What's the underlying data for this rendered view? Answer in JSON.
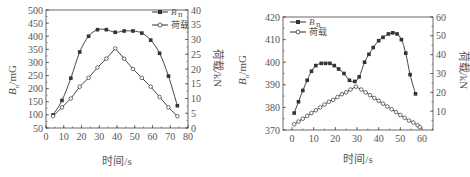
{
  "chart_data": [
    {
      "type": "line",
      "title": "",
      "xlabel": "时间/s",
      "ylabel": "B_n/mG",
      "y2label": "荷载/kN",
      "xlim": [
        0,
        80
      ],
      "ylim": [
        50,
        500
      ],
      "y2lim": [
        0,
        40
      ],
      "x_ticks": [
        "0",
        "10",
        "20",
        "30",
        "40",
        "50",
        "60",
        "70",
        "80"
      ],
      "y_ticks": [
        "50",
        "100",
        "150",
        "200",
        "250",
        "300",
        "350",
        "400",
        "450",
        "500"
      ],
      "y2_ticks": [
        "0",
        "5",
        "10",
        "15",
        "20",
        "25",
        "30",
        "35",
        "40"
      ],
      "legend": [
        "B_n",
        "荷载"
      ],
      "legend_position": "upper right",
      "grid": false,
      "series": [
        {
          "name": "B_n",
          "axis": "left",
          "marker": "filled-square",
          "x": [
            4,
            9,
            14,
            19,
            24,
            29,
            34,
            39,
            44,
            49,
            54,
            59,
            64,
            69,
            74
          ],
          "values": [
            100,
            155,
            240,
            340,
            400,
            425,
            425,
            415,
            420,
            420,
            412,
            385,
            335,
            248,
            135
          ]
        },
        {
          "name": "荷载",
          "axis": "right",
          "marker": "open-circle",
          "x": [
            4,
            9,
            14,
            19,
            24,
            29,
            34,
            39,
            44,
            49,
            54,
            59,
            64,
            69,
            74
          ],
          "values": [
            4,
            7,
            10,
            14,
            17,
            20.5,
            23.5,
            27,
            23.5,
            20,
            17,
            14,
            10.5,
            7,
            4
          ]
        }
      ]
    },
    {
      "type": "line",
      "title": "",
      "xlabel": "时间/s",
      "ylabel": "B_n/mG",
      "y2label": "荷载/kN",
      "xlim": [
        -5,
        65
      ],
      "ylim": [
        370,
        420
      ],
      "y2lim": [
        0,
        60
      ],
      "x_ticks": [
        "0",
        "10",
        "20",
        "30",
        "40",
        "50",
        "60"
      ],
      "y_ticks": [
        "370",
        "380",
        "390",
        "400",
        "410",
        "420"
      ],
      "y2_ticks": [
        "10",
        "20",
        "30",
        "40",
        "50",
        "60"
      ],
      "legend": [
        "B_n",
        "荷载"
      ],
      "legend_position": "upper left",
      "grid": false,
      "series": [
        {
          "name": "B_n",
          "axis": "left",
          "marker": "filled-square",
          "x": [
            1,
            3,
            5,
            7,
            9,
            11,
            13.5,
            15.5,
            17.5,
            19.5,
            21.5,
            24,
            26.5,
            29,
            31,
            33.5,
            35.5,
            37.5,
            40,
            42,
            44.5,
            46.5,
            48.5,
            50.5,
            52.5,
            54.5,
            57,
            58.5
          ],
          "values": [
            377.5,
            382.5,
            387.5,
            392,
            396,
            398.5,
            399.5,
            399.5,
            399.5,
            398.5,
            397,
            395,
            392,
            391.5,
            393.5,
            400,
            403.5,
            406.5,
            409.5,
            411,
            412.5,
            413,
            412.5,
            410,
            404,
            394.5,
            386,
            null
          ]
        },
        {
          "name": "荷载",
          "axis": "right",
          "marker": "open-circle",
          "x": [
            1,
            3,
            5,
            7,
            9,
            11,
            13,
            15,
            17,
            19,
            21,
            23,
            25,
            27,
            29.5,
            32,
            34,
            36,
            38,
            40,
            42,
            44,
            46,
            48,
            50,
            52,
            54,
            56,
            58,
            59
          ],
          "values": [
            3,
            4.5,
            6,
            7.5,
            9,
            10.5,
            12,
            13.5,
            15,
            16,
            17.5,
            19,
            20,
            21.5,
            23,
            21.5,
            20,
            18.5,
            17,
            15.5,
            14,
            12.5,
            11,
            9.5,
            8,
            6.5,
            5,
            4,
            2.5,
            1.5
          ]
        }
      ]
    }
  ],
  "left_chart": {
    "ylabel_main": "B",
    "ylabel_sub": "n",
    "ylabel_unit": "/mG",
    "y2label": "荷载/kN",
    "xlabel": "时间/s",
    "legend": [
      {
        "label_main": "B",
        "label_sub": "n"
      },
      {
        "label": "荷载"
      }
    ]
  },
  "right_chart": {
    "ylabel_main": "B",
    "ylabel_sub": "n",
    "ylabel_unit": "/mG",
    "y2label": "荷载/kN",
    "xlabel": "时间/s",
    "legend": [
      {
        "label_main": "B",
        "label_sub": "n"
      },
      {
        "label": "荷载"
      }
    ]
  }
}
